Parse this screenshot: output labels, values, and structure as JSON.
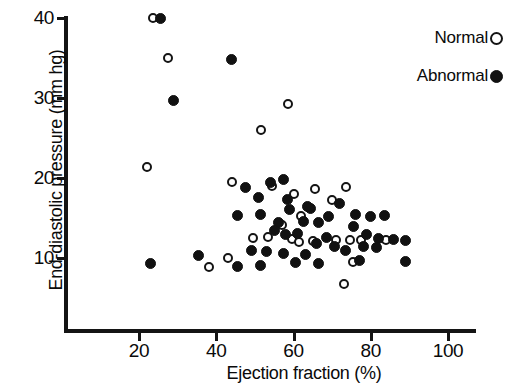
{
  "chart_data": {
    "type": "scatter",
    "title": "",
    "xlabel": "Ejection fraction (%)",
    "ylabel": "End-diastolic pressure (mm hg)",
    "xlim": [
      8,
      108
    ],
    "ylim": [
      4.5,
      41
    ],
    "xticks": [
      20,
      40,
      60,
      80,
      100
    ],
    "yticks": [
      10,
      20,
      30,
      40
    ],
    "grid": false,
    "legend_position": "top-right",
    "series": [
      {
        "name": "Normal",
        "marker": "open-circle",
        "color": "#141414",
        "points": [
          [
            23.5,
            40.0
          ],
          [
            27.5,
            35.0
          ],
          [
            22.0,
            21.4
          ],
          [
            58.5,
            29.3
          ],
          [
            51.5,
            26.0
          ],
          [
            44.0,
            19.5
          ],
          [
            54.5,
            19.0
          ],
          [
            38.0,
            8.9
          ],
          [
            43.0,
            10.0
          ],
          [
            60.0,
            18.0
          ],
          [
            65.5,
            18.6
          ],
          [
            73.5,
            18.9
          ],
          [
            70.0,
            17.2
          ],
          [
            62.0,
            15.2
          ],
          [
            57.0,
            14.1
          ],
          [
            59.5,
            12.4
          ],
          [
            61.5,
            12.0
          ],
          [
            65.0,
            12.1
          ],
          [
            53.5,
            12.6
          ],
          [
            49.5,
            12.5
          ],
          [
            71.0,
            12.3
          ],
          [
            74.5,
            12.2
          ],
          [
            77.5,
            12.3
          ],
          [
            84.0,
            12.2
          ],
          [
            75.5,
            9.5
          ],
          [
            73.0,
            6.8
          ]
        ]
      },
      {
        "name": "Abnormal",
        "marker": "filled-circle",
        "color": "#111111",
        "points": [
          [
            25.5,
            40.0
          ],
          [
            44.0,
            34.8
          ],
          [
            29.0,
            29.7
          ],
          [
            57.5,
            19.8
          ],
          [
            23.0,
            9.3
          ],
          [
            47.5,
            18.8
          ],
          [
            54.0,
            19.5
          ],
          [
            51.0,
            17.6
          ],
          [
            45.5,
            15.3
          ],
          [
            51.5,
            15.4
          ],
          [
            56.0,
            14.4
          ],
          [
            58.5,
            17.3
          ],
          [
            59.0,
            16.1
          ],
          [
            63.5,
            16.4
          ],
          [
            64.5,
            16.2
          ],
          [
            62.5,
            14.6
          ],
          [
            66.5,
            14.5
          ],
          [
            55.0,
            13.5
          ],
          [
            58.0,
            13.0
          ],
          [
            61.0,
            13.1
          ],
          [
            69.0,
            15.2
          ],
          [
            72.0,
            16.8
          ],
          [
            76.0,
            15.4
          ],
          [
            80.0,
            15.2
          ],
          [
            83.5,
            15.3
          ],
          [
            75.5,
            14.0
          ],
          [
            79.0,
            13.0
          ],
          [
            82.0,
            12.5
          ],
          [
            86.0,
            12.3
          ],
          [
            68.5,
            12.6
          ],
          [
            66.0,
            11.8
          ],
          [
            70.5,
            11.5
          ],
          [
            78.0,
            11.4
          ],
          [
            81.5,
            11.3
          ],
          [
            49.0,
            11.0
          ],
          [
            53.0,
            10.8
          ],
          [
            57.5,
            10.6
          ],
          [
            63.0,
            10.5
          ],
          [
            60.5,
            9.4
          ],
          [
            66.5,
            9.3
          ],
          [
            45.5,
            9.0
          ],
          [
            51.5,
            9.1
          ],
          [
            89.0,
            12.2
          ],
          [
            89.0,
            9.6
          ],
          [
            35.5,
            10.3
          ],
          [
            77.0,
            9.7
          ],
          [
            73.5,
            10.9
          ]
        ]
      }
    ]
  },
  "legend": {
    "items": [
      {
        "label": "Normal",
        "marker": "open"
      },
      {
        "label": "Abnormal",
        "marker": "filled"
      }
    ]
  },
  "axes": {
    "y_title": "End-diastolic pressure (mm hg)",
    "x_title": "Ejection fraction (%)",
    "y_tick_labels": [
      "40",
      "30",
      "20",
      "10"
    ],
    "x_tick_labels": [
      "20",
      "40",
      "60",
      "80",
      "100"
    ]
  }
}
